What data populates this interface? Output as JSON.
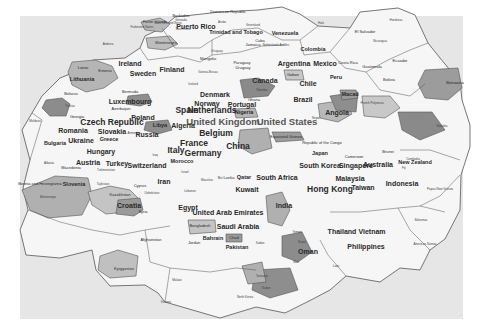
{
  "map": {
    "background": "#e6e6e6",
    "region_fill_light": "#f4f4f4",
    "region_fill_mid": "#b8b8b8",
    "region_fill_dark": "#8a8a8a",
    "border_color": "#555555",
    "labels": [
      {
        "text": "Dominican Republic",
        "x": 228,
        "y": 12,
        "size": 2
      },
      {
        "text": "Aruba",
        "x": 222,
        "y": 22,
        "size": 1
      },
      {
        "text": "Barbados",
        "x": 181,
        "y": 16,
        "size": 2
      },
      {
        "text": "Saint Kitts and Nevis",
        "x": 168,
        "y": 23,
        "size": 1
      },
      {
        "text": "Grenada",
        "x": 181,
        "y": 20,
        "size": 1
      },
      {
        "text": "Puerto Rico",
        "x": 196,
        "y": 26,
        "size": 4
      },
      {
        "text": "Saint Lucia",
        "x": 183,
        "y": 29,
        "size": 1
      },
      {
        "text": "Greenland",
        "x": 253,
        "y": 25,
        "size": 1
      },
      {
        "text": "Trinidad and Tobago",
        "x": 236,
        "y": 33,
        "size": 3
      },
      {
        "text": "Venezuela",
        "x": 285,
        "y": 34,
        "size": 3
      },
      {
        "text": "Haiti",
        "x": 321,
        "y": 23,
        "size": 1
      },
      {
        "text": "Honduras",
        "x": 396,
        "y": 20,
        "size": 1
      },
      {
        "text": "El Salvador",
        "x": 365,
        "y": 32,
        "size": 2
      },
      {
        "text": "Nicaragua",
        "x": 380,
        "y": 41,
        "size": 1
      },
      {
        "text": "Faroe Islands",
        "x": 155,
        "y": 22,
        "size": 2
      },
      {
        "text": "Federated States",
        "x": 142,
        "y": 27,
        "size": 1
      },
      {
        "text": "Andorra",
        "x": 108,
        "y": 44,
        "size": 1
      },
      {
        "text": "Montenegro",
        "x": 166,
        "y": 43,
        "size": 2
      },
      {
        "text": "Jamaica",
        "x": 253,
        "y": 45,
        "size": 2
      },
      {
        "text": "Netherlands Antilles",
        "x": 276,
        "y": 45,
        "size": 1
      },
      {
        "text": "Cuba",
        "x": 260,
        "y": 41,
        "size": 2
      },
      {
        "text": "Uruguay",
        "x": 217,
        "y": 51,
        "size": 1
      },
      {
        "text": "Paraguay",
        "x": 242,
        "y": 63,
        "size": 2
      },
      {
        "text": "Colombia",
        "x": 313,
        "y": 50,
        "size": 3
      },
      {
        "text": "Mongolia",
        "x": 208,
        "y": 59,
        "size": 2
      },
      {
        "text": "Ireland",
        "x": 130,
        "y": 63,
        "size": 4
      },
      {
        "text": "Argentina",
        "x": 294,
        "y": 63,
        "size": 4
      },
      {
        "text": "Mexico",
        "x": 325,
        "y": 63,
        "size": 4
      },
      {
        "text": "Costa Rica",
        "x": 348,
        "y": 63,
        "size": 2
      },
      {
        "text": "Guatemala",
        "x": 372,
        "y": 67,
        "size": 2
      },
      {
        "text": "Ecuador",
        "x": 400,
        "y": 61,
        "size": 2
      },
      {
        "text": "Latvia",
        "x": 83,
        "y": 68,
        "size": 2
      },
      {
        "text": "Estonia",
        "x": 105,
        "y": 71,
        "size": 2
      },
      {
        "text": "Lithuania",
        "x": 82,
        "y": 80,
        "size": 3
      },
      {
        "text": "Sweden",
        "x": 143,
        "y": 73,
        "size": 4
      },
      {
        "text": "Finland",
        "x": 172,
        "y": 69,
        "size": 4
      },
      {
        "text": "Guinea-Bissau",
        "x": 208,
        "y": 72,
        "size": 1
      },
      {
        "text": "Uruguay",
        "x": 243,
        "y": 68,
        "size": 2
      },
      {
        "text": "Canada",
        "x": 265,
        "y": 80,
        "size": 4
      },
      {
        "text": "Gabon",
        "x": 293,
        "y": 75,
        "size": 2
      },
      {
        "text": "Peru",
        "x": 336,
        "y": 78,
        "size": 3
      },
      {
        "text": "Chile",
        "x": 308,
        "y": 83,
        "size": 4
      },
      {
        "text": "Bolivia",
        "x": 389,
        "y": 80,
        "size": 2
      },
      {
        "text": "Botswana",
        "x": 455,
        "y": 83,
        "size": 2
      },
      {
        "text": "Bermuda",
        "x": 130,
        "y": 92,
        "size": 2
      },
      {
        "text": "Iceland",
        "x": 193,
        "y": 84,
        "size": 1
      },
      {
        "text": "Denmark",
        "x": 215,
        "y": 94,
        "size": 4
      },
      {
        "text": "Norway",
        "x": 207,
        "y": 103,
        "size": 4
      },
      {
        "text": "Portugal",
        "x": 242,
        "y": 104,
        "size": 4
      },
      {
        "text": "Ghana",
        "x": 254,
        "y": 100,
        "size": 2
      },
      {
        "text": "Namibia",
        "x": 262,
        "y": 90,
        "size": 1
      },
      {
        "text": "Brazil",
        "x": 303,
        "y": 99,
        "size": 4
      },
      {
        "text": "Macau",
        "x": 350,
        "y": 95,
        "size": 3
      },
      {
        "text": "French Polynesia",
        "x": 372,
        "y": 103,
        "size": 1
      },
      {
        "text": "Luxembourg",
        "x": 130,
        "y": 101,
        "size": 4
      },
      {
        "text": "Belarus",
        "x": 71,
        "y": 94,
        "size": 2
      },
      {
        "text": "Tunisia",
        "x": 70,
        "y": 106,
        "size": 1
      },
      {
        "text": "Azerbaijan",
        "x": 121,
        "y": 109,
        "size": 2
      },
      {
        "text": "Spain",
        "x": 187,
        "y": 110,
        "size": 5
      },
      {
        "text": "Netherlands",
        "x": 212,
        "y": 110,
        "size": 5
      },
      {
        "text": "Nigeria",
        "x": 244,
        "y": 113,
        "size": 3
      },
      {
        "text": "United Kingdom",
        "x": 223,
        "y": 122,
        "size": 6
      },
      {
        "text": "United States",
        "x": 287,
        "y": 122,
        "size": 6
      },
      {
        "text": "Angola",
        "x": 337,
        "y": 112,
        "size": 4
      },
      {
        "text": "Nepal",
        "x": 316,
        "y": 118,
        "size": 1
      },
      {
        "text": "Poland",
        "x": 143,
        "y": 117,
        "size": 4
      },
      {
        "text": "Czech Republic",
        "x": 112,
        "y": 122,
        "size": 5
      },
      {
        "text": "Georgia",
        "x": 77,
        "y": 117,
        "size": 2
      },
      {
        "text": "Moldova",
        "x": 35,
        "y": 121,
        "size": 1
      },
      {
        "text": "Libya",
        "x": 160,
        "y": 126,
        "size": 3
      },
      {
        "text": "Algeria",
        "x": 183,
        "y": 125,
        "size": 4
      },
      {
        "text": "Belgium",
        "x": 216,
        "y": 133,
        "size": 5
      },
      {
        "text": "Equatorial Guinea",
        "x": 286,
        "y": 137,
        "size": 2
      },
      {
        "text": "Republic of the Congo",
        "x": 322,
        "y": 143,
        "size": 2
      },
      {
        "text": "Namibia",
        "x": 442,
        "y": 126,
        "size": 1
      },
      {
        "text": "Slovakia",
        "x": 112,
        "y": 131,
        "size": 4
      },
      {
        "text": "Romania",
        "x": 73,
        "y": 130,
        "size": 4
      },
      {
        "text": "Armenia",
        "x": 133,
        "y": 133,
        "size": 1
      },
      {
        "text": "Russia",
        "x": 147,
        "y": 134,
        "size": 4
      },
      {
        "text": "Greece",
        "x": 109,
        "y": 140,
        "size": 3
      },
      {
        "text": "Ukraine",
        "x": 81,
        "y": 140,
        "size": 4
      },
      {
        "text": "Bulgaria",
        "x": 55,
        "y": 144,
        "size": 3
      },
      {
        "text": "France",
        "x": 194,
        "y": 143,
        "size": 5
      },
      {
        "text": "China",
        "x": 238,
        "y": 146,
        "size": 5
      },
      {
        "text": "Italy",
        "x": 176,
        "y": 150,
        "size": 5
      },
      {
        "text": "Germany",
        "x": 203,
        "y": 153,
        "size": 5
      },
      {
        "text": "Cameroon",
        "x": 354,
        "y": 157,
        "size": 2
      },
      {
        "text": "Brunei",
        "x": 388,
        "y": 152,
        "size": 2
      },
      {
        "text": "Hungary",
        "x": 101,
        "y": 151,
        "size": 4
      },
      {
        "text": "Iraq",
        "x": 155,
        "y": 155,
        "size": 1
      },
      {
        "text": "Japan",
        "x": 320,
        "y": 154,
        "size": 3
      },
      {
        "text": "Cambodia",
        "x": 413,
        "y": 159,
        "size": 1
      },
      {
        "text": "New Zealand",
        "x": 415,
        "y": 163,
        "size": 3
      },
      {
        "text": "Fiji",
        "x": 404,
        "y": 168,
        "size": 1
      },
      {
        "text": "Austria",
        "x": 88,
        "y": 162,
        "size": 4
      },
      {
        "text": "Turkey",
        "x": 117,
        "y": 163,
        "size": 4
      },
      {
        "text": "Switzerland",
        "x": 147,
        "y": 165,
        "size": 4
      },
      {
        "text": "Morocco",
        "x": 182,
        "y": 162,
        "size": 3
      },
      {
        "text": "South Korea",
        "x": 320,
        "y": 165,
        "size": 4
      },
      {
        "text": "Singapore",
        "x": 356,
        "y": 165,
        "size": 4
      },
      {
        "text": "Australia",
        "x": 378,
        "y": 164,
        "size": 4
      },
      {
        "text": "Albania",
        "x": 49,
        "y": 163,
        "size": 1
      },
      {
        "text": "Macedonia",
        "x": 71,
        "y": 168,
        "size": 2
      },
      {
        "text": "Turkmenistan",
        "x": 106,
        "y": 170,
        "size": 1
      },
      {
        "text": "Israel",
        "x": 185,
        "y": 172,
        "size": 1
      },
      {
        "text": "Qatar",
        "x": 244,
        "y": 178,
        "size": 3
      },
      {
        "text": "South Africa",
        "x": 277,
        "y": 177,
        "size": 4
      },
      {
        "text": "Malaysia",
        "x": 350,
        "y": 178,
        "size": 4
      },
      {
        "text": "Indonesia",
        "x": 402,
        "y": 183,
        "size": 4
      },
      {
        "text": "Papua New Guinea",
        "x": 440,
        "y": 189,
        "size": 1
      },
      {
        "text": "Bosnia and Herzegovina",
        "x": 40,
        "y": 184,
        "size": 2
      },
      {
        "text": "Slovenia",
        "x": 74,
        "y": 185,
        "size": 3
      },
      {
        "text": "Tajikistan",
        "x": 103,
        "y": 184,
        "size": 1
      },
      {
        "text": "Cyprus",
        "x": 140,
        "y": 186,
        "size": 2
      },
      {
        "text": "Iran",
        "x": 164,
        "y": 181,
        "size": 4
      },
      {
        "text": "Mauritius",
        "x": 207,
        "y": 180,
        "size": 1
      },
      {
        "text": "Sri Lanka",
        "x": 226,
        "y": 178,
        "size": 2
      },
      {
        "text": "Kuwait",
        "x": 247,
        "y": 189,
        "size": 4
      },
      {
        "text": "Hong Kong",
        "x": 330,
        "y": 189,
        "size": 5
      },
      {
        "text": "Taiwan",
        "x": 363,
        "y": 187,
        "size": 4
      },
      {
        "text": "Uzbekistan",
        "x": 152,
        "y": 193,
        "size": 1
      },
      {
        "text": "Lebanon",
        "x": 190,
        "y": 191,
        "size": 1
      },
      {
        "text": "Montenegro",
        "x": 48,
        "y": 197,
        "size": 1
      },
      {
        "text": "Kazakhstan",
        "x": 120,
        "y": 195,
        "size": 2
      },
      {
        "text": "Croatia",
        "x": 129,
        "y": 205,
        "size": 4
      },
      {
        "text": "Syria",
        "x": 143,
        "y": 212,
        "size": 2
      },
      {
        "text": "Egypt",
        "x": 188,
        "y": 207,
        "size": 4
      },
      {
        "text": "United Arab Emirates",
        "x": 228,
        "y": 212,
        "size": 4
      },
      {
        "text": "Saudi Arabia",
        "x": 238,
        "y": 226,
        "size": 4
      },
      {
        "text": "India",
        "x": 284,
        "y": 205,
        "size": 4
      },
      {
        "text": "Thailand",
        "x": 342,
        "y": 231,
        "size": 4
      },
      {
        "text": "Vietnam",
        "x": 372,
        "y": 231,
        "size": 4
      },
      {
        "text": "Bahamas",
        "x": 421,
        "y": 220,
        "size": 1
      },
      {
        "text": "Philippines",
        "x": 366,
        "y": 246,
        "size": 4
      },
      {
        "text": "American Samoa",
        "x": 425,
        "y": 244,
        "size": 1
      },
      {
        "text": "Kyrgyzstan",
        "x": 124,
        "y": 269,
        "size": 2
      },
      {
        "text": "Afghanistan",
        "x": 151,
        "y": 240,
        "size": 2
      },
      {
        "text": "Jordan",
        "x": 194,
        "y": 243,
        "size": 2
      },
      {
        "text": "Bahrain",
        "x": 213,
        "y": 239,
        "size": 3
      },
      {
        "text": "Chad",
        "x": 234,
        "y": 238,
        "size": 2
      },
      {
        "text": "Pakistan",
        "x": 237,
        "y": 248,
        "size": 3
      },
      {
        "text": "Bangladesh",
        "x": 200,
        "y": 226,
        "size": 2
      },
      {
        "text": "Oman",
        "x": 308,
        "y": 251,
        "size": 4
      },
      {
        "text": "Yemen",
        "x": 297,
        "y": 232,
        "size": 1
      },
      {
        "text": "Nepal",
        "x": 302,
        "y": 242,
        "size": 1
      },
      {
        "text": "Sudan",
        "x": 260,
        "y": 243,
        "size": 1
      },
      {
        "text": "Laos",
        "x": 336,
        "y": 266,
        "size": 1
      },
      {
        "text": "Mali",
        "x": 296,
        "y": 262,
        "size": 1
      },
      {
        "text": "Malawi",
        "x": 177,
        "y": 280,
        "size": 1
      },
      {
        "text": "Kosovo",
        "x": 166,
        "y": 302,
        "size": 1
      },
      {
        "text": "North Korea",
        "x": 245,
        "y": 297,
        "size": 1
      },
      {
        "text": "Sudan",
        "x": 266,
        "y": 288,
        "size": 1
      },
      {
        "text": "Tanzania",
        "x": 262,
        "y": 276,
        "size": 1
      }
    ]
  }
}
